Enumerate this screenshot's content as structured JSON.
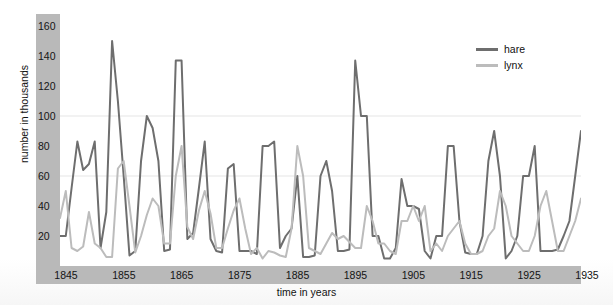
{
  "chart_data": {
    "type": "line",
    "title": "",
    "xlabel": "time in years",
    "ylabel": "number in thousands",
    "xlim": [
      1845,
      1935
    ],
    "ylim": [
      0,
      168
    ],
    "yticks": [
      20,
      40,
      60,
      80,
      100,
      120,
      140,
      160
    ],
    "xticks": [
      1845,
      1855,
      1865,
      1875,
      1885,
      1895,
      1905,
      1915,
      1925,
      1935
    ],
    "grid": "faint horizontal gridlines at 60 and 100",
    "legend_position": "top-right",
    "x": [
      1845,
      1846,
      1847,
      1848,
      1849,
      1850,
      1851,
      1852,
      1853,
      1854,
      1855,
      1856,
      1857,
      1858,
      1859,
      1860,
      1861,
      1862,
      1863,
      1864,
      1865,
      1866,
      1867,
      1868,
      1869,
      1870,
      1871,
      1872,
      1873,
      1874,
      1875,
      1876,
      1877,
      1878,
      1879,
      1880,
      1881,
      1882,
      1883,
      1884,
      1885,
      1886,
      1887,
      1888,
      1889,
      1890,
      1891,
      1892,
      1893,
      1894,
      1895,
      1896,
      1897,
      1898,
      1899,
      1900,
      1901,
      1902,
      1903,
      1904,
      1905,
      1906,
      1907,
      1908,
      1909,
      1910,
      1911,
      1912,
      1913,
      1914,
      1915,
      1916,
      1917,
      1918,
      1919,
      1920,
      1921,
      1922,
      1923,
      1924,
      1925,
      1926,
      1927,
      1928,
      1929,
      1930,
      1931,
      1932,
      1933,
      1934,
      1935
    ],
    "series": [
      {
        "name": "hare",
        "color": "#6e6e6e",
        "values": [
          20,
          20,
          52,
          83,
          64,
          68,
          83,
          12,
          36,
          150,
          110,
          60,
          7,
          10,
          70,
          100,
          92,
          70,
          10,
          11,
          137,
          137,
          18,
          22,
          52,
          83,
          18,
          10,
          9,
          65,
          68,
          10,
          10,
          10,
          8,
          80,
          80,
          83,
          12,
          20,
          25,
          60,
          6,
          6,
          7,
          60,
          70,
          50,
          10,
          10,
          11,
          137,
          100,
          100,
          20,
          20,
          5,
          5,
          12,
          58,
          40,
          40,
          38,
          10,
          5,
          20,
          20,
          80,
          80,
          30,
          9,
          8,
          8,
          20,
          70,
          90,
          60,
          5,
          10,
          20,
          60,
          60,
          80,
          10,
          10,
          10,
          11,
          20,
          30,
          60,
          90
        ]
      },
      {
        "name": "lynx",
        "color": "#bcbcbc",
        "values": [
          32,
          50,
          12,
          10,
          13,
          36,
          15,
          12,
          6,
          6,
          65,
          70,
          40,
          9,
          20,
          34,
          45,
          40,
          15,
          15,
          60,
          80,
          26,
          18,
          37,
          50,
          35,
          12,
          12,
          25,
          37,
          45,
          25,
          8,
          12,
          5,
          10,
          9,
          7,
          6,
          25,
          80,
          60,
          12,
          10,
          8,
          15,
          22,
          18,
          20,
          16,
          12,
          12,
          40,
          30,
          15,
          15,
          10,
          8,
          30,
          30,
          40,
          30,
          40,
          10,
          15,
          10,
          20,
          25,
          30,
          15,
          8,
          8,
          10,
          20,
          25,
          50,
          40,
          20,
          15,
          10,
          10,
          20,
          40,
          50,
          30,
          10,
          10,
          20,
          30,
          45
        ]
      }
    ]
  },
  "axes": {
    "ylabel": "number in thousands",
    "xlabel": "time in years",
    "yticks": [
      "160",
      "140",
      "120",
      "100",
      "80",
      "60",
      "40",
      "20"
    ],
    "xticks": [
      "1845",
      "1855",
      "1865",
      "1875",
      "1885",
      "1895",
      "1905",
      "1915",
      "1925",
      "1935"
    ]
  },
  "legend": {
    "items": [
      {
        "label": "hare",
        "color": "#6e6e6e"
      },
      {
        "label": "lynx",
        "color": "#bcbcbc"
      }
    ]
  },
  "colors": {
    "hare": "#6e6e6e",
    "lynx": "#bcbcbc",
    "axis_band": "#b9b9b9",
    "plot_bg": "#ffffff",
    "gridline": "#f2f2f2"
  }
}
